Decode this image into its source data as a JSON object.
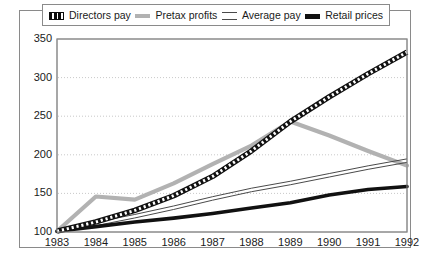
{
  "chart_data": {
    "type": "line",
    "title": "",
    "xlabel": "",
    "ylabel": "",
    "x": [
      1983,
      1984,
      1985,
      1986,
      1987,
      1988,
      1989,
      1990,
      1991,
      1992
    ],
    "xticklabels": [
      "1983",
      "1984",
      "1985",
      "1986",
      "1987",
      "1988",
      "1989",
      "1990",
      "1991",
      "1992"
    ],
    "yticklabels": [
      "100",
      "150",
      "200",
      "250",
      "300",
      "350"
    ],
    "yticks": [
      100,
      150,
      200,
      250,
      300,
      350
    ],
    "ylim": [
      100,
      350
    ],
    "xlim": [
      1983,
      1992
    ],
    "grid": "horizontal-dotted",
    "legend_position": "top",
    "series": [
      {
        "name": "Directors pay",
        "style": "dashed-thick-black",
        "color": "#111111",
        "values": [
          101,
          113,
          128,
          147,
          172,
          205,
          243,
          275,
          305,
          333
        ]
      },
      {
        "name": "Pretax profits",
        "style": "thick-gray",
        "color": "#b2b2b2",
        "values": [
          101,
          146,
          142,
          163,
          188,
          212,
          243,
          225,
          205,
          186
        ]
      },
      {
        "name": "Average pay",
        "style": "double-thin-line",
        "color": "#4a4a4a",
        "values": [
          101,
          110,
          120,
          131,
          143,
          154,
          163,
          173,
          183,
          192
        ]
      },
      {
        "name": "Retail prices",
        "style": "thick-black",
        "color": "#111111",
        "values": [
          101,
          107,
          113,
          118,
          124,
          131,
          138,
          148,
          155,
          159
        ]
      }
    ]
  },
  "legend": {
    "items": [
      {
        "label": "Directors pay",
        "marker": "dashed-swatch"
      },
      {
        "label": "Pretax profits",
        "marker": "gray-swatch"
      },
      {
        "label": "Average pay",
        "marker": "double-line-swatch"
      },
      {
        "label": "Retail prices",
        "marker": "black-swatch"
      }
    ]
  },
  "colors": {
    "directors_pay": "#111111",
    "pretax_profits": "#b2b2b2",
    "average_pay": "#4a4a4a",
    "retail_prices": "#111111",
    "grid": "#c9c9c9",
    "axis": "#8a8a8a",
    "text": "#1a1a1a"
  }
}
